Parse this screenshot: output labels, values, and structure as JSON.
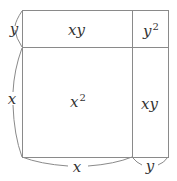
{
  "diagram": {
    "colors": {
      "stroke": "#8a8a8a",
      "text": "#333333",
      "background": "#ffffff"
    },
    "regions": [
      {
        "id": "top-left",
        "label_base": "xy",
        "label_exp": ""
      },
      {
        "id": "top-right",
        "label_base": "y",
        "label_exp": "2"
      },
      {
        "id": "bottom-left",
        "label_base": "x",
        "label_exp": "2"
      },
      {
        "id": "bottom-right",
        "label_base": "xy",
        "label_exp": ""
      }
    ],
    "side_labels": {
      "left_top": "y",
      "left_bottom": "x",
      "bottom_left": "x",
      "bottom_right": "y"
    }
  }
}
